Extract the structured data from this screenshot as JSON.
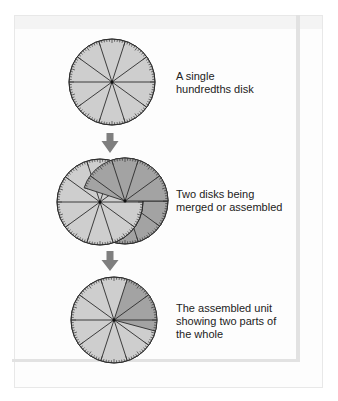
{
  "colors": {
    "disk_light": "#cecece",
    "disk_dark": "#a3a3a3",
    "line": "#2b2b2b",
    "tick": "#333333",
    "arrow": "#7f7f7f",
    "text": "#222222"
  },
  "steps": [
    {
      "caption_lines": [
        "A single",
        "hundredths disk"
      ],
      "caption_top": 70
    },
    {
      "caption_lines": [
        "Two disks being",
        "merged or assembled"
      ],
      "caption_top": 188
    },
    {
      "caption_lines": [
        "The assembled unit",
        "showing two parts of",
        "the whole"
      ],
      "caption_top": 302
    }
  ],
  "disk_geometry": {
    "radius": 43,
    "spoke_angles_deg": [
      0,
      36,
      72,
      108,
      144,
      180,
      216,
      252,
      288,
      324
    ],
    "tick_count": 100,
    "single_disk": {
      "cx": 112,
      "cy": 82
    },
    "merging_disks": {
      "light": {
        "cx": 100,
        "cy": 202
      },
      "dark": {
        "cx": 125,
        "cy": 201,
        "visible_from_deg": 0,
        "visible_to_deg": 162
      }
    },
    "assembled_disk": {
      "cx": 114,
      "cy": 320,
      "dark_from_deg": -15,
      "dark_to_deg": 72
    }
  },
  "arrows": [
    {
      "x": 110,
      "shaft_top": 133,
      "head_top": 141,
      "tip": 153
    },
    {
      "x": 110,
      "shaft_top": 251,
      "head_top": 260,
      "tip": 271
    }
  ]
}
